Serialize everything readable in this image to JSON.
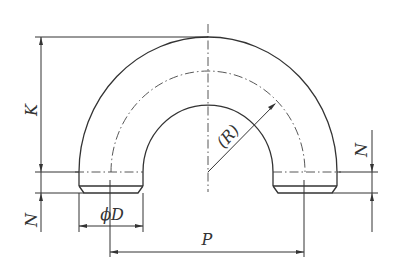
{
  "figure": {
    "labels": {
      "K": "K",
      "N_left": "N",
      "N_right": "N",
      "phiD": "ϕD",
      "P": "P",
      "R": "(R)"
    },
    "colors": {
      "line": "#333333",
      "background": "#ffffff"
    }
  }
}
